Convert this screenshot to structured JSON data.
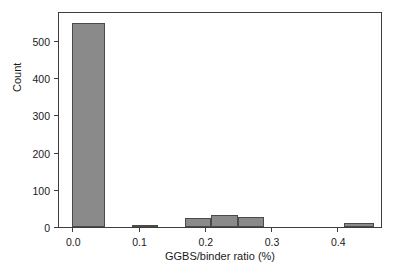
{
  "chart_data": {
    "type": "bar",
    "title": "",
    "xlabel": "GGBS/binder ratio (%)",
    "ylabel": "Count",
    "xlim": [
      -0.02,
      0.466
    ],
    "ylim": [
      0,
      575
    ],
    "grid": false,
    "legend": null,
    "bar_color": "#8a8a8a",
    "bar_edge_color": "#4a4a4a",
    "axis_color": "#3d3d3d",
    "xticks": [
      0.0,
      0.1,
      0.2,
      0.3,
      0.4
    ],
    "xtick_labels": [
      "0.0",
      "0.1",
      "0.2",
      "0.3",
      "0.4"
    ],
    "yticks": [
      0,
      100,
      200,
      300,
      400,
      500
    ],
    "ytick_labels": [
      "0",
      "100",
      "200",
      "300",
      "400",
      "500"
    ],
    "bins": [
      {
        "x0": 0.0,
        "x1": 0.05,
        "value": 548
      },
      {
        "x0": 0.09,
        "x1": 0.13,
        "value": 3
      },
      {
        "x0": 0.17,
        "x1": 0.21,
        "value": 25
      },
      {
        "x0": 0.21,
        "x1": 0.25,
        "value": 31
      },
      {
        "x0": 0.25,
        "x1": 0.29,
        "value": 27
      },
      {
        "x0": 0.41,
        "x1": 0.455,
        "value": 12
      }
    ]
  }
}
